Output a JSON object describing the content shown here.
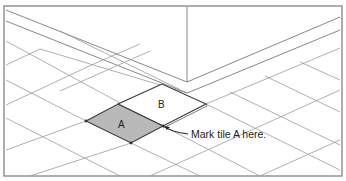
{
  "figure": {
    "tiles": [
      {
        "id": "A",
        "label": "A",
        "fill": "#b9b9b9"
      },
      {
        "id": "B",
        "label": "B",
        "fill": "#ffffff"
      }
    ],
    "callout": {
      "text": "Mark tile A here."
    }
  }
}
